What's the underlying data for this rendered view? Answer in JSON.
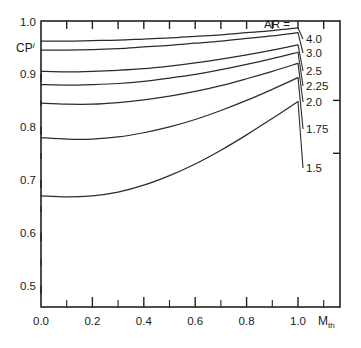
{
  "chart_data": {
    "type": "line",
    "title": "",
    "xlabel": "M_th",
    "xlabel_base": "M",
    "xlabel_sub": "th",
    "ylabel": "CP^i",
    "ylabel_base": "CP",
    "ylabel_sup": "i",
    "xlim": [
      0.0,
      1.0
    ],
    "ylim": [
      0.46,
      1.0
    ],
    "grid": false,
    "legend_position": "right-inline",
    "legend_title": "AR =",
    "x_tick_labels": [
      "0.0",
      "0.2",
      "0.4",
      "0.6",
      "0.8",
      "1.0"
    ],
    "x_tick_values": [
      0.0,
      0.2,
      0.4,
      0.6,
      0.8,
      1.0
    ],
    "x_minor_ticks": [
      0.1,
      0.3,
      0.5,
      0.7,
      0.9
    ],
    "y_tick_labels": [
      "0.5",
      "0.6",
      "0.7",
      "0.8",
      "0.9",
      "1.0"
    ],
    "y_tick_values": [
      0.5,
      0.6,
      0.7,
      0.8,
      0.9,
      1.0
    ],
    "y_minor_ticks": [
      0.55,
      0.65,
      0.75,
      0.85,
      0.95
    ],
    "x": [
      0.0,
      0.1,
      0.2,
      0.3,
      0.4,
      0.5,
      0.6,
      0.7,
      0.8,
      0.9,
      1.0
    ],
    "series": [
      {
        "name": "4.0",
        "label": "4.0",
        "values": [
          0.962,
          0.962,
          0.963,
          0.964,
          0.966,
          0.968,
          0.971,
          0.974,
          0.978,
          0.982,
          0.987
        ]
      },
      {
        "name": "3.0",
        "label": "3.0",
        "values": [
          0.945,
          0.945,
          0.946,
          0.948,
          0.951,
          0.954,
          0.958,
          0.962,
          0.967,
          0.972,
          0.978
        ]
      },
      {
        "name": "2.5",
        "label": "2.5",
        "values": [
          0.905,
          0.904,
          0.905,
          0.907,
          0.91,
          0.915,
          0.921,
          0.928,
          0.936,
          0.945,
          0.955
        ]
      },
      {
        "name": "2.25",
        "label": "2.25",
        "values": [
          0.88,
          0.879,
          0.88,
          0.882,
          0.886,
          0.892,
          0.899,
          0.908,
          0.918,
          0.929,
          0.941
        ]
      },
      {
        "name": "2.0",
        "label": "2.0",
        "values": [
          0.845,
          0.843,
          0.843,
          0.846,
          0.851,
          0.858,
          0.867,
          0.878,
          0.891,
          0.905,
          0.92
        ]
      },
      {
        "name": "1.75",
        "label": "1.75",
        "values": [
          0.78,
          0.777,
          0.777,
          0.781,
          0.789,
          0.8,
          0.814,
          0.831,
          0.85,
          0.871,
          0.893
        ]
      },
      {
        "name": "1.5",
        "label": "1.5",
        "values": [
          0.67,
          0.668,
          0.67,
          0.677,
          0.69,
          0.708,
          0.73,
          0.756,
          0.785,
          0.816,
          0.848
        ]
      }
    ],
    "colors": {
      "curve": "#2b2b2b",
      "axis": "#222222",
      "text": "#1a1a1a",
      "background": "#ffffff"
    }
  }
}
